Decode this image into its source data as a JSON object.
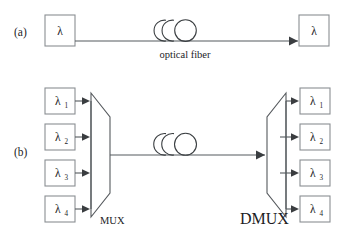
{
  "figure": {
    "panels": [
      {
        "id": "panel-a",
        "label": "(a)",
        "source_label": "λ",
        "dest_label": "λ",
        "link_label": "optical fiber"
      },
      {
        "id": "panel-b",
        "label": "(b)",
        "mux_label": "MUX",
        "dmux_label": "DMUX",
        "inputs": [
          {
            "label": "λ",
            "sub": "1"
          },
          {
            "label": "λ",
            "sub": "2"
          },
          {
            "label": "λ",
            "sub": "3"
          },
          {
            "label": "λ",
            "sub": "4"
          }
        ],
        "outputs": [
          {
            "label": "λ",
            "sub": "1"
          },
          {
            "label": "λ",
            "sub": "2"
          },
          {
            "label": "λ",
            "sub": "3"
          },
          {
            "label": "λ",
            "sub": "4"
          }
        ]
      }
    ],
    "colors": {
      "background": "#ffffff",
      "line": "#555a5e",
      "box_border": "#8a8f93",
      "coil": "#3b3f42",
      "text": "#1d1d1f"
    }
  }
}
